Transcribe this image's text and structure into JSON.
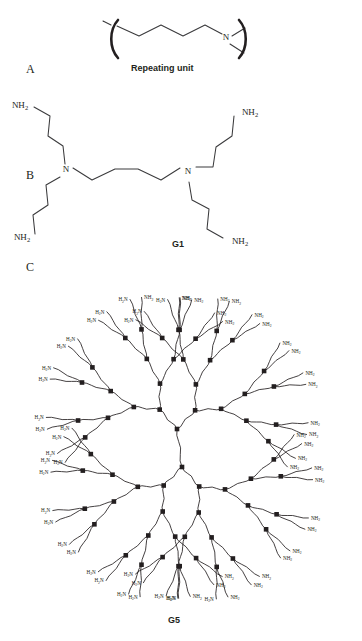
{
  "figure": {
    "background": "#ffffff",
    "ink": "#231f20",
    "bond_color": "#3a3a3c",
    "width": 362,
    "height": 641
  },
  "panels": [
    {
      "id": "A",
      "letter": "A",
      "caption": "Repeating unit",
      "description": "Polypropylenimine repeating unit drawn inside polymer brackets, a three-carbon zig-zag chain terminating at a tertiary nitrogen.",
      "atom_labels": [
        "N"
      ],
      "bracket": "square-polymer-bracket"
    },
    {
      "id": "B",
      "letter": "B",
      "caption": "G1",
      "description": "Generation 1 poly(propylene imine) dendrimer: a butanediamine core bearing two tertiary nitrogens, each carrying two propylamine arms ending in primary amines.",
      "atom_labels": [
        "N",
        "N"
      ],
      "terminal_labels": [
        "NH2",
        "NH2",
        "NH2",
        "NH2"
      ],
      "terminal_count": 4
    },
    {
      "id": "C",
      "letter": "C",
      "caption": "G5",
      "description": "Generation 5 poly(propylene imine) dendrimer: radial tree from a two-nitrogen core branching through five generations to 64 primary amine end groups.",
      "generations": 5,
      "terminal_count": 64,
      "terminal_label_left": "H2N",
      "terminal_label_right": "NH2",
      "node_glyph": "filled-square-nitrogen"
    }
  ],
  "labels": {
    "nitrogen": "N",
    "amine_right": "NH",
    "amine_left": "H",
    "amine_left_tail": "N",
    "subscript_2": "2"
  },
  "captions": {
    "repeating_unit": "Repeating unit",
    "g1": "G1",
    "g5": "G5"
  },
  "panel_letters": {
    "a": "A",
    "b": "B",
    "c": "C"
  }
}
